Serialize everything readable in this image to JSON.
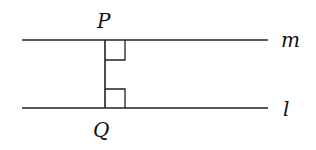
{
  "diagram": {
    "labels": {
      "point_top": "P",
      "point_bottom": "Q",
      "line_top": "m",
      "line_bottom": "l"
    },
    "colors": {
      "stroke": "#222222",
      "background": "#ffffff"
    }
  }
}
